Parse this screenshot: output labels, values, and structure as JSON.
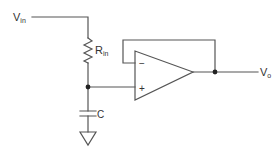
{
  "diagram": {
    "type": "circuit-schematic",
    "title": "",
    "colors": {
      "line": "#555555",
      "text": "#333333",
      "background": "#ffffff"
    },
    "labels": {
      "vin": {
        "main": "V",
        "sub": "in"
      },
      "rin": {
        "main": "R",
        "sub": "in"
      },
      "c": {
        "main": "C"
      },
      "vo": {
        "main": "V",
        "sub": "o"
      },
      "minus": "−",
      "plus": "+"
    },
    "components": [
      {
        "id": "Vin",
        "kind": "input-terminal",
        "label": "Vin"
      },
      {
        "id": "Rin",
        "kind": "resistor",
        "label": "Rin"
      },
      {
        "id": "C",
        "kind": "capacitor",
        "label": "C"
      },
      {
        "id": "GND",
        "kind": "ground",
        "label": ""
      },
      {
        "id": "U1",
        "kind": "op-amp",
        "inputs": [
          "−",
          "+"
        ],
        "config": "voltage-follower"
      },
      {
        "id": "Vo",
        "kind": "output-terminal",
        "label": "Vo"
      }
    ],
    "connections": [
      [
        "Vin",
        "Rin"
      ],
      [
        "Rin",
        "C"
      ],
      [
        "Rin",
        "U1.+"
      ],
      [
        "C",
        "GND"
      ],
      [
        "U1.out",
        "U1.−"
      ],
      [
        "U1.out",
        "Vo"
      ]
    ]
  }
}
